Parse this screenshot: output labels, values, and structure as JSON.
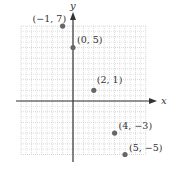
{
  "chart_data": {
    "type": "scatter",
    "title": "",
    "xlabel": "x",
    "ylabel": "y",
    "xlim": [
      -5,
      7
    ],
    "ylim": [
      -5,
      7
    ],
    "grid": true,
    "points": [
      {
        "x": -1,
        "y": 7,
        "label": "(−1, 7)"
      },
      {
        "x": 0,
        "y": 5,
        "label": "(0, 5)"
      },
      {
        "x": 2,
        "y": 1,
        "label": "(2, 1)"
      },
      {
        "x": 4,
        "y": -3,
        "label": "(4, −3)"
      },
      {
        "x": 5,
        "y": -5,
        "label": "(5, −5)"
      }
    ]
  },
  "colors": {
    "axis": "#333333",
    "grid": "#bdbdbd",
    "point": "#666666",
    "text": "#333333"
  }
}
